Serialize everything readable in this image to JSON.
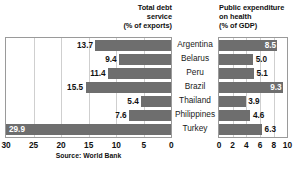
{
  "source_note": "Source: World Bank",
  "colors": {
    "bar": "#6e6e6e",
    "panel_border": "#9a9a9a",
    "gridline": "#cfcfcf",
    "text": "#1a1a1a",
    "label_inside": "#ffffff",
    "background": "#ffffff"
  },
  "left_header": "Total debt\nservice\n(% of exports)",
  "right_header": "Public expenditure\non health\n(% of GDP)",
  "countries": [
    "Argentina",
    "Belarus",
    "Peru",
    "Brazil",
    "Thailand",
    "Philippines",
    "Turkey"
  ],
  "left_axis_ticks": [
    "30",
    "25",
    "20",
    "15",
    "10",
    "5",
    "0"
  ],
  "right_axis_ticks": [
    "0",
    "2",
    "4",
    "6",
    "8",
    "10"
  ],
  "left_values": [
    "13.7",
    "9.4",
    "11.4",
    "15.5",
    "5.4",
    "7.6",
    "29.9"
  ],
  "right_values": [
    "8.5",
    "5.0",
    "5.1",
    "9.3",
    "3.9",
    "4.6",
    "6.3"
  ],
  "chart_data": [
    {
      "type": "bar",
      "orientation": "horizontal-reversed",
      "title": "Total debt service (% of exports)",
      "xlabel": "% of exports",
      "ylabel": "",
      "categories": [
        "Argentina",
        "Belarus",
        "Peru",
        "Brazil",
        "Thailand",
        "Philippines",
        "Turkey"
      ],
      "values": [
        13.7,
        9.4,
        11.4,
        15.5,
        5.4,
        7.6,
        29.9
      ],
      "xlim": [
        30,
        0
      ],
      "xticks": [
        30,
        25,
        20,
        15,
        10,
        5,
        0
      ],
      "grid": true,
      "legend": "none",
      "annotations": [
        "Source: World Bank"
      ],
      "data_labels": [
        "13.7",
        "9.4",
        "11.4",
        "15.5",
        "5.4",
        "7.6",
        "29.9"
      ]
    },
    {
      "type": "bar",
      "orientation": "horizontal",
      "title": "Public expenditure on health (% of GDP)",
      "xlabel": "% of GDP",
      "ylabel": "",
      "categories": [
        "Argentina",
        "Belarus",
        "Peru",
        "Brazil",
        "Thailand",
        "Philippines",
        "Turkey"
      ],
      "values": [
        8.5,
        5.0,
        5.1,
        9.3,
        3.9,
        4.6,
        6.3
      ],
      "xlim": [
        0,
        10
      ],
      "xticks": [
        0,
        2,
        4,
        6,
        8,
        10
      ],
      "grid": true,
      "legend": "none",
      "data_labels": [
        "8.5",
        "5.0",
        "5.1",
        "9.3",
        "3.9",
        "4.6",
        "6.3"
      ]
    }
  ]
}
